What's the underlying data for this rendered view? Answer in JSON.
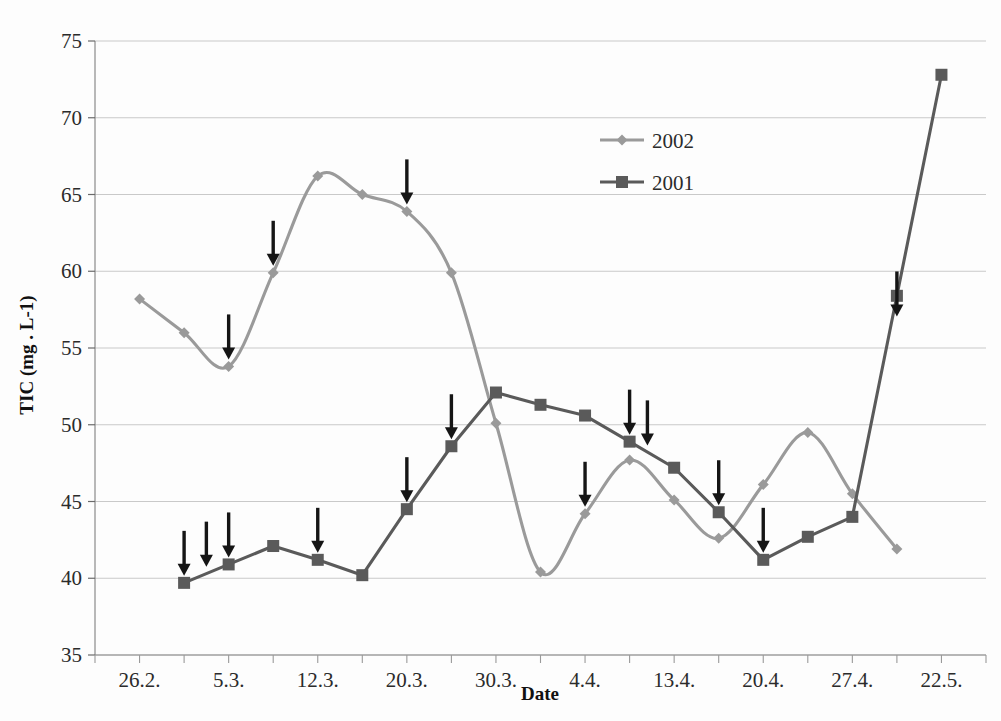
{
  "chart_data": {
    "type": "line",
    "title": "",
    "xlabel": "Date",
    "ylabel": "TIC (mg . L-1)",
    "ylim": [
      35,
      75
    ],
    "yticks": [
      35,
      40,
      45,
      50,
      55,
      60,
      65,
      70,
      75
    ],
    "xtick_labels": [
      "26.2.",
      "5.3.",
      "12.3.",
      "20.3.",
      "30.3.",
      "4.4.",
      "13.4.",
      "20.4.",
      "27.4.",
      "22.5."
    ],
    "xtick_index": [
      1,
      3,
      5,
      7,
      9,
      11,
      13,
      15,
      17,
      19
    ],
    "x_slots": 20,
    "grid": true,
    "legend_position": "top-center",
    "series": [
      {
        "name": "2002",
        "color": "#9a9a9a",
        "marker": "diamond",
        "smooth": true,
        "points": [
          {
            "i": 1,
            "y": 58.2
          },
          {
            "i": 2,
            "y": 56.0
          },
          {
            "i": 3,
            "y": 53.8
          },
          {
            "i": 4,
            "y": 59.9
          },
          {
            "i": 5,
            "y": 66.2
          },
          {
            "i": 6,
            "y": 65.0
          },
          {
            "i": 7,
            "y": 63.9
          },
          {
            "i": 8,
            "y": 59.9
          },
          {
            "i": 9,
            "y": 50.1
          },
          {
            "i": 10,
            "y": 40.4
          },
          {
            "i": 11,
            "y": 44.2
          },
          {
            "i": 12,
            "y": 47.7
          },
          {
            "i": 13,
            "y": 45.1
          },
          {
            "i": 14,
            "y": 42.6
          },
          {
            "i": 15,
            "y": 46.1
          },
          {
            "i": 16,
            "y": 49.5
          },
          {
            "i": 17,
            "y": 45.5
          },
          {
            "i": 18,
            "y": 41.9
          }
        ]
      },
      {
        "name": "2001",
        "color": "#5a5a5a",
        "marker": "square",
        "smooth": false,
        "points": [
          {
            "i": 2,
            "y": 39.7
          },
          {
            "i": 3,
            "y": 40.9
          },
          {
            "i": 4,
            "y": 42.1
          },
          {
            "i": 5,
            "y": 41.2
          },
          {
            "i": 6,
            "y": 40.2
          },
          {
            "i": 7,
            "y": 44.5
          },
          {
            "i": 8,
            "y": 48.6
          },
          {
            "i": 9,
            "y": 52.1
          },
          {
            "i": 10,
            "y": 51.3
          },
          {
            "i": 11,
            "y": 50.6
          },
          {
            "i": 12,
            "y": 48.9
          },
          {
            "i": 13,
            "y": 47.2
          },
          {
            "i": 14,
            "y": 44.3
          },
          {
            "i": 15,
            "y": 41.2
          },
          {
            "i": 16,
            "y": 42.7
          },
          {
            "i": 17,
            "y": 44.0
          },
          {
            "i": 18,
            "y": 58.4
          },
          {
            "i": 19,
            "y": 72.8
          }
        ]
      }
    ],
    "annotations": [
      {
        "type": "down-arrow",
        "i": 2.0,
        "y": 39.7,
        "series": "2001"
      },
      {
        "type": "down-arrow",
        "i": 2.5,
        "y": 40.3,
        "series": "2001"
      },
      {
        "type": "down-arrow",
        "i": 3.0,
        "y": 40.9,
        "series": "2001"
      },
      {
        "type": "down-arrow",
        "i": 3.0,
        "y": 53.8,
        "series": "2002"
      },
      {
        "type": "down-arrow",
        "i": 4.0,
        "y": 59.9,
        "series": "2002"
      },
      {
        "type": "down-arrow",
        "i": 5.0,
        "y": 41.2,
        "series": "2001"
      },
      {
        "type": "down-arrow",
        "i": 7.0,
        "y": 63.9,
        "series": "2002"
      },
      {
        "type": "down-arrow",
        "i": 7.0,
        "y": 44.5,
        "series": "2001"
      },
      {
        "type": "down-arrow",
        "i": 8.0,
        "y": 48.6,
        "series": "2001"
      },
      {
        "type": "down-arrow",
        "i": 11.0,
        "y": 44.2,
        "series": "2002"
      },
      {
        "type": "down-arrow",
        "i": 12.0,
        "y": 48.9,
        "series": "2001"
      },
      {
        "type": "down-arrow",
        "i": 12.4,
        "y": 48.2,
        "series": "2001"
      },
      {
        "type": "down-arrow",
        "i": 14.0,
        "y": 44.3,
        "series": "2001"
      },
      {
        "type": "down-arrow",
        "i": 15.0,
        "y": 41.2,
        "series": "2001"
      },
      {
        "type": "down-arrow",
        "i": 18.0,
        "y": 56.6,
        "series": "2001"
      }
    ]
  }
}
